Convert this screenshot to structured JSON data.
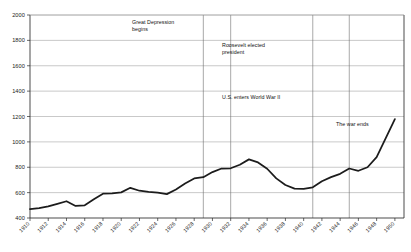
{
  "chart_data": {
    "type": "line",
    "title": "",
    "xlabel": "",
    "ylabel": "",
    "xlim": [
      1910,
      1951
    ],
    "ylim": [
      400,
      2000
    ],
    "ytick_step": 200,
    "xtick_step": 2,
    "grid": true,
    "legend": "none",
    "yticks": [
      400,
      600,
      800,
      1000,
      1200,
      1400,
      1600,
      1800,
      2000
    ],
    "xticks": [
      1910,
      1912,
      1914,
      1916,
      1918,
      1920,
      1922,
      1924,
      1926,
      1928,
      1930,
      1932,
      1934,
      1936,
      1938,
      1940,
      1942,
      1944,
      1946,
      1948,
      1950
    ],
    "x": [
      1910,
      1911,
      1912,
      1913,
      1914,
      1915,
      1916,
      1917,
      1918,
      1919,
      1920,
      1921,
      1922,
      1923,
      1924,
      1925,
      1926,
      1927,
      1928,
      1929,
      1930,
      1931,
      1932,
      1933,
      1934,
      1935,
      1936,
      1937,
      1938,
      1939,
      1940,
      1941,
      1942,
      1943,
      1944,
      1945,
      1946,
      1947,
      1948,
      1949,
      1950
    ],
    "values": [
      470,
      478,
      492,
      510,
      530,
      495,
      500,
      540,
      592,
      595,
      600,
      638,
      620,
      605,
      598,
      588,
      620,
      670,
      712,
      720,
      760,
      790,
      790,
      820,
      862,
      840,
      790,
      715,
      660,
      632,
      630,
      640,
      690,
      720,
      745,
      790,
      770,
      800,
      880,
      1030,
      1180
    ],
    "series": [
      {
        "name": "index",
        "points": [
          {
            "year": 1910,
            "value": 470
          },
          {
            "year": 1911,
            "value": 478
          },
          {
            "year": 1912,
            "value": 492
          },
          {
            "year": 1913,
            "value": 512
          },
          {
            "year": 1914,
            "value": 532
          },
          {
            "year": 1915,
            "value": 495
          },
          {
            "year": 1916,
            "value": 500
          },
          {
            "year": 1917,
            "value": 548
          },
          {
            "year": 1918,
            "value": 592
          },
          {
            "year": 1919,
            "value": 595
          },
          {
            "year": 1920,
            "value": 602
          },
          {
            "year": 1921,
            "value": 638
          },
          {
            "year": 1922,
            "value": 615
          },
          {
            "year": 1923,
            "value": 605
          },
          {
            "year": 1924,
            "value": 600
          },
          {
            "year": 1925,
            "value": 588
          },
          {
            "year": 1926,
            "value": 625
          },
          {
            "year": 1927,
            "value": 672
          },
          {
            "year": 1928,
            "value": 712
          },
          {
            "year": 1929,
            "value": 722
          },
          {
            "year": 1930,
            "value": 762
          },
          {
            "year": 1931,
            "value": 790
          },
          {
            "year": 1932,
            "value": 792
          },
          {
            "year": 1933,
            "value": 820
          },
          {
            "year": 1934,
            "value": 862
          },
          {
            "year": 1935,
            "value": 838
          },
          {
            "year": 1936,
            "value": 788
          },
          {
            "year": 1937,
            "value": 712
          },
          {
            "year": 1938,
            "value": 660
          },
          {
            "year": 1939,
            "value": 632
          },
          {
            "year": 1940,
            "value": 630
          },
          {
            "year": 1941,
            "value": 642
          },
          {
            "year": 1942,
            "value": 690
          },
          {
            "year": 1943,
            "value": 722
          },
          {
            "year": 1944,
            "value": 748
          },
          {
            "year": 1945,
            "value": 790
          },
          {
            "year": 1946,
            "value": 772
          },
          {
            "year": 1947,
            "value": 800
          },
          {
            "year": 1948,
            "value": 880
          },
          {
            "year": 1949,
            "value": 1030
          },
          {
            "year": 1950,
            "value": 1180
          }
        ]
      }
    ],
    "annotations": [
      {
        "id": "great-depression",
        "text_line1": "Great Depression",
        "text_line2": "begins",
        "year": 1929
      },
      {
        "id": "roosevelt-elected",
        "text_line1": "Roosevelt elected",
        "text_line2": "president",
        "year": 1932
      },
      {
        "id": "us-enters-wwii",
        "text_line1": "U.S. enters World War II",
        "text_line2": "",
        "year": 1941
      },
      {
        "id": "war-ends",
        "text_line1": "The war ends",
        "text_line2": "",
        "year": 1945
      }
    ],
    "event_lines": [
      1929,
      1932,
      1941,
      1945
    ],
    "colors": {
      "series": "#1c1c1c",
      "grid": "#9c9c9c",
      "event_line": "#6f6f6f",
      "axis": "#2a2a2a",
      "text": "#111111",
      "background": "#ffffff"
    }
  }
}
